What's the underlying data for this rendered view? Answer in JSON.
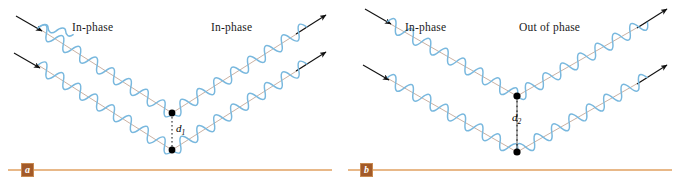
{
  "figure": {
    "type": "physics-diagram",
    "background_color": "#ffffff",
    "wave_color": "#79B8DE",
    "ray_color": "#C4A898",
    "arrow_color": "#111111",
    "baseline_color": "#E0A060",
    "badge_color": "#A35A28",
    "dot_color": "#000000"
  },
  "panels": [
    {
      "id": "a",
      "badge": "a",
      "labels": {
        "incoming": "In-phase",
        "outgoing": "In-phase"
      },
      "spacing": {
        "symbol": "d",
        "subscript": "1",
        "text": "d"
      },
      "incoming_arrows": 2,
      "outgoing_arrows": 2,
      "vertices": [
        {
          "x": 172,
          "y": 113
        },
        {
          "x": 172,
          "y": 150
        }
      ]
    },
    {
      "id": "b",
      "badge": "b",
      "labels": {
        "incoming": "In-phase",
        "outgoing": "Out of phase"
      },
      "spacing": {
        "symbol": "d",
        "subscript": "2",
        "text": "d"
      },
      "incoming_arrows": 2,
      "outgoing_arrows": 2,
      "vertices": [
        {
          "x": 177,
          "y": 96
        },
        {
          "x": 177,
          "y": 152
        }
      ]
    }
  ]
}
